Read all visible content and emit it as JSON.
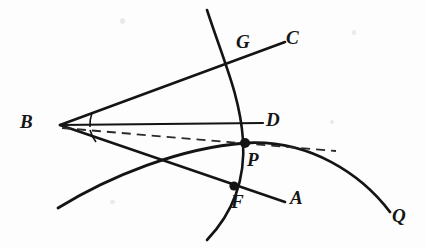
{
  "figure": {
    "kind": "geometry-diagram",
    "width": 426,
    "height": 249,
    "background_color": "#fdfdfd",
    "ink_color": "#141414"
  },
  "labels": [
    {
      "id": "B",
      "text": "B",
      "x": 20,
      "y": 112
    },
    {
      "id": "G",
      "text": "G",
      "x": 236,
      "y": 32
    },
    {
      "id": "C",
      "text": "C",
      "x": 286,
      "y": 28
    },
    {
      "id": "D",
      "text": "D",
      "x": 266,
      "y": 110
    },
    {
      "id": "P",
      "text": "P",
      "x": 247,
      "y": 150
    },
    {
      "id": "F",
      "text": "F",
      "x": 231,
      "y": 192
    },
    {
      "id": "A",
      "text": "A",
      "x": 290,
      "y": 188
    },
    {
      "id": "Q",
      "text": "Q",
      "x": 392,
      "y": 206
    }
  ],
  "points": [
    {
      "id": "B",
      "x": 60,
      "y": 125,
      "marked": false
    },
    {
      "id": "P",
      "x": 245,
      "y": 143,
      "marked": true
    },
    {
      "id": "F",
      "x": 234,
      "y": 186,
      "marked": true
    },
    {
      "id": "G",
      "x": 236,
      "y": 65,
      "marked": false
    },
    {
      "id": "D",
      "x": 263,
      "y": 123,
      "marked": false
    }
  ],
  "segments": [
    {
      "id": "ray-BC",
      "from": "B",
      "to": "C",
      "style": "solid",
      "width": 2.6,
      "path": "M 60 125 L 285 42"
    },
    {
      "id": "ray-BA",
      "from": "B",
      "to": "A",
      "style": "solid",
      "width": 2.6,
      "path": "M 60 125 L 285 202"
    },
    {
      "id": "segment-BD",
      "from": "B",
      "to": "D",
      "style": "solid",
      "width": 2.2,
      "path": "M 60 125 L 263 123"
    },
    {
      "id": "segment-BP-dashed",
      "from": "B",
      "to": "tangent-end",
      "style": "dashed",
      "width": 1.8,
      "path": "M 62 128 L 336 151"
    }
  ],
  "curves": [
    {
      "id": "arc-GPF",
      "description": "circular arc through G, P and F",
      "style": "solid",
      "width": 2.6,
      "path": "M 207 10 C 224 62 240 96 243 140 C 246 186 228 218 207 240"
    },
    {
      "id": "curve-Q",
      "description": "conic passing through P toward Q",
      "style": "solid",
      "width": 2.8,
      "path": "M 58 208 C 110 176 180 148 245 143 C 310 139 362 175 390 212"
    }
  ],
  "angle_marks": [
    {
      "id": "angle-CBD",
      "description": "angle between ray BC and segment BD at B",
      "path": "M 92 113 A 34 34 0 0 0 90 127"
    },
    {
      "id": "angle-DBA",
      "description": "angle between segment BD and ray BA at B",
      "path": "M 90 130 A 34 34 0 0 0 96 142"
    }
  ]
}
